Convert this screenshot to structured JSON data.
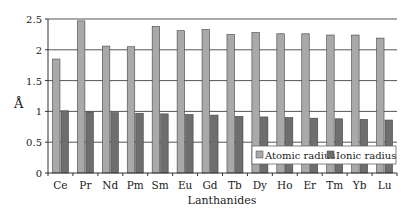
{
  "chart_data": {
    "type": "bar",
    "title": "",
    "xlabel": "Lanthanides",
    "ylabel": "Å",
    "ylim": [
      0,
      2.5
    ],
    "yticks": [
      0,
      0.5,
      1,
      1.5,
      2,
      2.5
    ],
    "ytick_labels": [
      "0",
      "0.5",
      "1",
      "1.5",
      "2",
      "2.5"
    ],
    "grid": true,
    "legend_position": "lower right (inside plot)",
    "categories": [
      "Ce",
      "Pr",
      "Nd",
      "Pm",
      "Sm",
      "Eu",
      "Gd",
      "Tb",
      "Dy",
      "Ho",
      "Er",
      "Tm",
      "Yb",
      "Lu"
    ],
    "series": [
      {
        "name": "Atomic radius",
        "color": "#a9a9a9",
        "values": [
          1.85,
          2.47,
          2.06,
          2.05,
          2.38,
          2.31,
          2.33,
          2.25,
          2.28,
          2.26,
          2.26,
          2.24,
          2.24,
          2.19
        ]
      },
      {
        "name": "Ionic radius",
        "color": "#6e6e6e",
        "values": [
          1.01,
          0.99,
          0.98,
          0.97,
          0.96,
          0.95,
          0.94,
          0.92,
          0.91,
          0.9,
          0.89,
          0.88,
          0.87,
          0.86
        ]
      }
    ]
  },
  "labels": {
    "xlabel": "Lanthanides",
    "ylabel": "Å",
    "legend": [
      "Atomic radius",
      "Ionic radius"
    ]
  },
  "colors": {
    "atomic": "#a9a9a9",
    "ionic": "#6e6e6e",
    "grid": "#555555",
    "axis": "#333333"
  }
}
